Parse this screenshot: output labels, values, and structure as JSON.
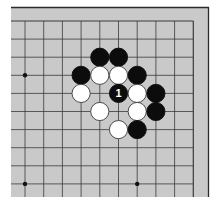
{
  "diagram": {
    "board_color": "#c9c9c9",
    "line_color": "#3a3a3a",
    "frame_color": "#2a2a2a",
    "black_stone_color": "#0c0c0c",
    "white_stone_color": "#ffffff",
    "grid": {
      "cols": 10,
      "rows": 10,
      "origin_x": 25,
      "origin_y": 21,
      "dx": 18.7,
      "dy": 18.1
    },
    "edges": [
      "top",
      "right"
    ],
    "star_points": [
      {
        "col": 0,
        "row": 3
      },
      {
        "col": 0,
        "row": 9
      },
      {
        "col": 6,
        "row": 9
      }
    ],
    "stones": [
      {
        "color": "black",
        "col": 4,
        "row": 2
      },
      {
        "color": "black",
        "col": 5,
        "row": 2
      },
      {
        "color": "black",
        "col": 3,
        "row": 3
      },
      {
        "color": "white",
        "col": 4,
        "row": 3
      },
      {
        "color": "white",
        "col": 5,
        "row": 3
      },
      {
        "color": "black",
        "col": 6,
        "row": 3
      },
      {
        "color": "white",
        "col": 3,
        "row": 4
      },
      {
        "color": "black",
        "col": 5,
        "row": 4,
        "label": "1"
      },
      {
        "color": "white",
        "col": 6,
        "row": 4
      },
      {
        "color": "black",
        "col": 7,
        "row": 4
      },
      {
        "color": "white",
        "col": 4,
        "row": 5
      },
      {
        "color": "white",
        "col": 6,
        "row": 5
      },
      {
        "color": "black",
        "col": 7,
        "row": 5
      },
      {
        "color": "white",
        "col": 5,
        "row": 6
      },
      {
        "color": "black",
        "col": 6,
        "row": 6
      }
    ]
  }
}
